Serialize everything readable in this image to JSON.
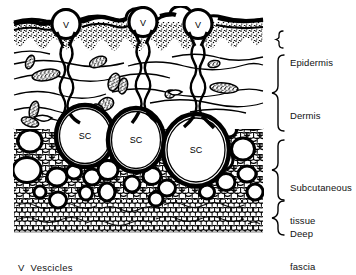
{
  "figure": {
    "type": "medical-histology-diagram",
    "ink_color": "#000000",
    "background_color": "#ffffff"
  },
  "layer_labels": {
    "epidermis": "Epidermis",
    "dermis": "Dermis",
    "subcutaneous_line1": "Subcutaneous",
    "subcutaneous_line2": "tissue",
    "deep_line1": "Deep",
    "deep_line2": "fascia"
  },
  "legend": {
    "key": "V",
    "text": "V  Vescicles"
  },
  "structures": {
    "vesicles": [
      {
        "label": "V",
        "cx": 66,
        "cy": 24
      },
      {
        "label": "V",
        "cx": 143,
        "cy": 22
      },
      {
        "label": "V",
        "cx": 198,
        "cy": 24
      }
    ],
    "subcutaneous_cysts": [
      {
        "label": "SC",
        "cx": 85,
        "cy": 136
      },
      {
        "label": "SC",
        "cx": 136,
        "cy": 140
      },
      {
        "label": "SC",
        "cx": 196,
        "cy": 150
      }
    ]
  },
  "brackets": [
    {
      "name": "epidermis",
      "y_top": 31,
      "y_bottom": 46
    },
    {
      "name": "dermis",
      "y_top": 55,
      "y_bottom": 132
    },
    {
      "name": "subcutaneous-tissue",
      "y_top": 140,
      "y_bottom": 200
    },
    {
      "name": "deep-fascia",
      "y_top": 200,
      "y_bottom": 232
    }
  ]
}
